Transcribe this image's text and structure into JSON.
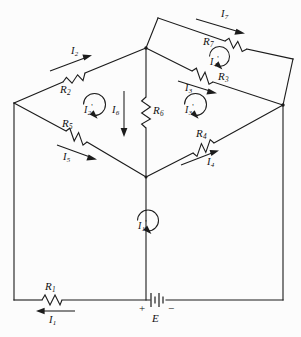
{
  "figure": {
    "kind": "circuit-schematic",
    "stroke_color": "#1b1b1b",
    "background_color": "#fcfcfc"
  },
  "resistors": [
    {
      "id": "R1",
      "name": "R",
      "sub": "1",
      "label": "R₁"
    },
    {
      "id": "R2",
      "name": "R",
      "sub": "2",
      "label": "R₂"
    },
    {
      "id": "R3",
      "name": "R",
      "sub": "3",
      "label": "R₃"
    },
    {
      "id": "R4",
      "name": "R",
      "sub": "4",
      "label": "R₄"
    },
    {
      "id": "R5",
      "name": "R",
      "sub": "5",
      "label": "R₅"
    },
    {
      "id": "R6",
      "name": "R",
      "sub": "6",
      "label": "R₆"
    },
    {
      "id": "R7",
      "name": "R",
      "sub": "7",
      "label": "R₇"
    }
  ],
  "branch_currents": [
    {
      "id": "I1",
      "name": "I",
      "sub": "1",
      "direction": "left"
    },
    {
      "id": "I2",
      "name": "I",
      "sub": "2",
      "direction": "up-right"
    },
    {
      "id": "I3",
      "name": "I",
      "sub": "3",
      "direction": "right-down"
    },
    {
      "id": "I4",
      "name": "I",
      "sub": "4",
      "direction": "up-right"
    },
    {
      "id": "I5",
      "name": "I",
      "sub": "5",
      "direction": "down-right"
    },
    {
      "id": "I6",
      "name": "I",
      "sub": "6",
      "direction": "down"
    },
    {
      "id": "I7",
      "name": "I",
      "sub": "7",
      "direction": "right-down"
    }
  ],
  "mesh_currents": [
    {
      "id": "I1p",
      "name": "I",
      "sub": "1",
      "prime": "'",
      "rotation": "clockwise"
    },
    {
      "id": "I2p",
      "name": "I",
      "sub": "2",
      "prime": "'",
      "rotation": "clockwise"
    },
    {
      "id": "I3p",
      "name": "I",
      "sub": "3",
      "prime": "'",
      "rotation": "clockwise"
    },
    {
      "id": "I4p",
      "name": "I",
      "sub": "4",
      "prime": "'",
      "rotation": "clockwise"
    }
  ],
  "source": {
    "id": "E",
    "label": "E",
    "plus": "+",
    "minus": "−",
    "type": "battery"
  }
}
